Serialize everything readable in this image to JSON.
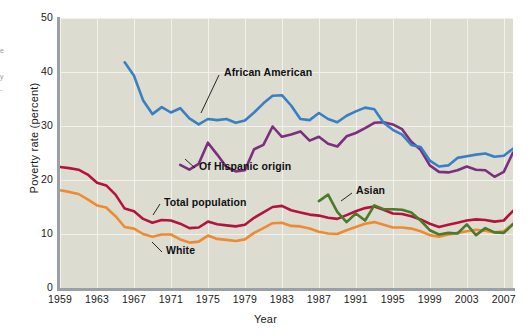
{
  "edge_caption_lines": [
    "e",
    "",
    "y",
    "-"
  ],
  "axes": {
    "ylabel": "Poverty rate (percent)",
    "xlabel": "Year",
    "yticks": [
      0,
      10,
      20,
      30,
      40,
      50
    ],
    "xticks": [
      1959,
      1963,
      1967,
      1971,
      1975,
      1979,
      1983,
      1987,
      1991,
      1995,
      1999,
      2003,
      2007
    ]
  },
  "colors": {
    "african_american": "#3a7ec4",
    "hispanic": "#7b2f7e",
    "total_population": "#b5123e",
    "white": "#ef8a33",
    "asian": "#4a7a2a",
    "plot_background": "#dcdcd1",
    "gridline": "#f2f2ec",
    "axis": "#9ba0a6"
  },
  "annotations": [
    {
      "name": "african-american",
      "text": "African American"
    },
    {
      "name": "of-hispanic-origin",
      "text": "Of Hispanic origin"
    },
    {
      "name": "total-population",
      "text": "Total population"
    },
    {
      "name": "white",
      "text": "White"
    },
    {
      "name": "asian",
      "text": "Asian"
    }
  ],
  "chart_data": {
    "type": "line",
    "title": "",
    "xlabel": "Year",
    "ylabel": "Poverty rate (percent)",
    "xlim": [
      1959,
      2008
    ],
    "ylim": [
      0,
      50
    ],
    "grid": "both",
    "legend": "inline-annotations",
    "series": [
      {
        "name": "African American",
        "color": "#3a7ec4",
        "x": [
          1966,
          1967,
          1968,
          1969,
          1970,
          1971,
          1972,
          1973,
          1974,
          1975,
          1976,
          1977,
          1978,
          1979,
          1980,
          1981,
          1982,
          1983,
          1984,
          1985,
          1986,
          1987,
          1988,
          1989,
          1990,
          1991,
          1992,
          1993,
          1994,
          1995,
          1996,
          1997,
          1998,
          1999,
          2000,
          2001,
          2002,
          2003,
          2004,
          2005,
          2006,
          2007,
          2008
        ],
        "values": [
          41.8,
          39.3,
          34.7,
          32.2,
          33.5,
          32.5,
          33.3,
          31.4,
          30.3,
          31.3,
          31.1,
          31.3,
          30.6,
          31.0,
          32.5,
          34.2,
          35.6,
          35.7,
          33.8,
          31.3,
          31.1,
          32.4,
          31.3,
          30.7,
          31.9,
          32.7,
          33.4,
          33.1,
          30.6,
          29.3,
          28.4,
          26.5,
          26.1,
          23.6,
          22.5,
          22.7,
          24.1,
          24.4,
          24.7,
          24.9,
          24.3,
          24.5,
          25.8
        ]
      },
      {
        "name": "Of Hispanic origin",
        "color": "#7b2f7e",
        "x": [
          1972,
          1973,
          1974,
          1975,
          1976,
          1977,
          1978,
          1979,
          1980,
          1981,
          1982,
          1983,
          1984,
          1985,
          1986,
          1987,
          1988,
          1989,
          1990,
          1991,
          1992,
          1993,
          1994,
          1995,
          1996,
          1997,
          1998,
          1999,
          2000,
          2001,
          2002,
          2003,
          2004,
          2005,
          2006,
          2007,
          2008
        ],
        "values": [
          22.8,
          21.9,
          23.0,
          26.9,
          24.7,
          22.4,
          21.6,
          21.8,
          25.7,
          26.5,
          29.9,
          28.0,
          28.4,
          29.0,
          27.3,
          28.0,
          26.7,
          26.2,
          28.1,
          28.7,
          29.6,
          30.6,
          30.7,
          30.3,
          29.4,
          27.1,
          25.6,
          22.7,
          21.5,
          21.4,
          21.8,
          22.5,
          21.9,
          21.8,
          20.6,
          21.5,
          25.1
        ]
      },
      {
        "name": "Total population",
        "color": "#b5123e",
        "x": [
          1959,
          1960,
          1961,
          1962,
          1963,
          1964,
          1965,
          1966,
          1967,
          1968,
          1969,
          1970,
          1971,
          1972,
          1973,
          1974,
          1975,
          1976,
          1977,
          1978,
          1979,
          1980,
          1981,
          1982,
          1983,
          1984,
          1985,
          1986,
          1987,
          1988,
          1989,
          1990,
          1991,
          1992,
          1993,
          1994,
          1995,
          1996,
          1997,
          1998,
          1999,
          2000,
          2001,
          2002,
          2003,
          2004,
          2005,
          2006,
          2007,
          2008
        ],
        "values": [
          22.4,
          22.2,
          21.9,
          21.0,
          19.5,
          19.0,
          17.3,
          14.7,
          14.2,
          12.8,
          12.1,
          12.6,
          12.5,
          11.9,
          11.1,
          11.2,
          12.3,
          11.8,
          11.6,
          11.4,
          11.7,
          13.0,
          14.0,
          15.0,
          15.2,
          14.4,
          14.0,
          13.6,
          13.4,
          13.0,
          12.8,
          13.5,
          14.2,
          14.8,
          15.1,
          14.5,
          13.8,
          13.7,
          13.3,
          12.7,
          11.9,
          11.3,
          11.7,
          12.1,
          12.5,
          12.7,
          12.6,
          12.3,
          12.5,
          14.3
        ]
      },
      {
        "name": "White",
        "color": "#ef8a33",
        "x": [
          1959,
          1960,
          1961,
          1962,
          1963,
          1964,
          1965,
          1966,
          1967,
          1968,
          1969,
          1970,
          1971,
          1972,
          1973,
          1974,
          1975,
          1976,
          1977,
          1978,
          1979,
          1980,
          1981,
          1982,
          1983,
          1984,
          1985,
          1986,
          1987,
          1988,
          1989,
          1990,
          1991,
          1992,
          1993,
          1994,
          1995,
          1996,
          1997,
          1998,
          1999,
          2000,
          2001,
          2002,
          2003,
          2004,
          2005,
          2006,
          2007,
          2008
        ],
        "values": [
          18.1,
          17.8,
          17.4,
          16.4,
          15.3,
          14.9,
          13.3,
          11.3,
          11.0,
          10.0,
          9.5,
          9.9,
          9.9,
          9.0,
          8.4,
          8.6,
          9.7,
          9.1,
          8.9,
          8.7,
          9.0,
          10.2,
          11.1,
          12.0,
          12.1,
          11.5,
          11.4,
          11.0,
          10.4,
          10.1,
          10.0,
          10.7,
          11.3,
          11.9,
          12.2,
          11.7,
          11.2,
          11.2,
          11.0,
          10.5,
          9.8,
          9.5,
          9.9,
          10.2,
          10.5,
          10.8,
          10.6,
          10.3,
          10.5,
          11.9
        ]
      },
      {
        "name": "Asian",
        "color": "#4a7a2a",
        "x": [
          1987,
          1988,
          1989,
          1990,
          1991,
          1992,
          1993,
          1994,
          1995,
          1996,
          1997,
          1998,
          1999,
          2000,
          2001,
          2002,
          2003,
          2004,
          2005,
          2006,
          2007,
          2008
        ],
        "values": [
          16.1,
          17.3,
          14.1,
          12.2,
          13.8,
          12.5,
          15.3,
          14.6,
          14.6,
          14.5,
          14.0,
          12.5,
          10.7,
          9.9,
          10.2,
          10.1,
          11.8,
          9.8,
          11.1,
          10.3,
          10.2,
          11.8
        ]
      }
    ]
  }
}
